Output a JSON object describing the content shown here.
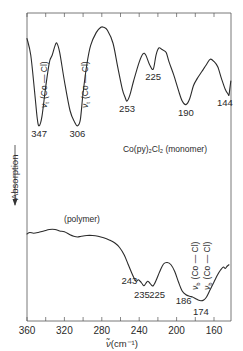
{
  "chart_data": {
    "type": "line",
    "title": "",
    "xlabel": "ν̃(cm⁻¹)",
    "ylabel": "Absorption",
    "ylabel_arrow": "down",
    "xlim": [
      360,
      142
    ],
    "x_reversed": true,
    "x_ticks": [
      360,
      320,
      280,
      240,
      200,
      160
    ],
    "x_tick_labels": [
      "360",
      "320",
      "280",
      "240",
      "200",
      "160"
    ],
    "x_minor_tick_step": 20,
    "y_ticks": [],
    "grid": false,
    "series": [
      {
        "name": "Co(py)2Cl2 (monomer)",
        "label": "Co(py)₂Cl₂ (monomer)",
        "points": [
          [
            360,
            0.86
          ],
          [
            356,
            0.72
          ],
          [
            352,
            0.42
          ],
          [
            349,
            0.18
          ],
          [
            347,
            0.12
          ],
          [
            344,
            0.2
          ],
          [
            340,
            0.45
          ],
          [
            336,
            0.66
          ],
          [
            333,
            0.72
          ],
          [
            330,
            0.8
          ],
          [
            328,
            0.82
          ],
          [
            325,
            0.74
          ],
          [
            320,
            0.5
          ],
          [
            314,
            0.25
          ],
          [
            309,
            0.15
          ],
          [
            306,
            0.12
          ],
          [
            303,
            0.17
          ],
          [
            300,
            0.4
          ],
          [
            296,
            0.64
          ],
          [
            292,
            0.8
          ],
          [
            286,
            0.91
          ],
          [
            281,
            0.955
          ],
          [
            278,
            0.955
          ],
          [
            274,
            0.93
          ],
          [
            268,
            0.82
          ],
          [
            263,
            0.62
          ],
          [
            258,
            0.43
          ],
          [
            255,
            0.36
          ],
          [
            253,
            0.33
          ],
          [
            250,
            0.38
          ],
          [
            246,
            0.5
          ],
          [
            240,
            0.66
          ],
          [
            236,
            0.73
          ],
          [
            233,
            0.72
          ],
          [
            229,
            0.64
          ],
          [
            225,
            0.6
          ],
          [
            222,
            0.72
          ],
          [
            219,
            0.78
          ],
          [
            216,
            0.77
          ],
          [
            214,
            0.76
          ],
          [
            211,
            0.74
          ],
          [
            208,
            0.66
          ],
          [
            203,
            0.55
          ],
          [
            198,
            0.42
          ],
          [
            194,
            0.33
          ],
          [
            190,
            0.3
          ],
          [
            186,
            0.35
          ],
          [
            182,
            0.46
          ],
          [
            178,
            0.52
          ],
          [
            173,
            0.58
          ],
          [
            168,
            0.64
          ],
          [
            164,
            0.685
          ],
          [
            160,
            0.665
          ],
          [
            156,
            0.62
          ],
          [
            152,
            0.52
          ],
          [
            148,
            0.43
          ],
          [
            145,
            0.39
          ],
          [
            144,
            0.38
          ],
          [
            143,
            0.44
          ],
          [
            142,
            0.5
          ]
        ],
        "peak_labels": [
          {
            "x": 347,
            "label": "347"
          },
          {
            "x": 306,
            "label": "306"
          },
          {
            "x": 253,
            "label": "253"
          },
          {
            "x": 225,
            "label": "225"
          },
          {
            "x": 190,
            "label": "190"
          },
          {
            "x": 144,
            "label": "144"
          }
        ]
      },
      {
        "name": "polymer",
        "label": "(polymer)",
        "points": [
          [
            360,
            0.44
          ],
          [
            357,
            0.45
          ],
          [
            353,
            0.445
          ],
          [
            348,
            0.45
          ],
          [
            342,
            0.46
          ],
          [
            336,
            0.47
          ],
          [
            330,
            0.47
          ],
          [
            325,
            0.46
          ],
          [
            320,
            0.455
          ],
          [
            314,
            0.435
          ],
          [
            310,
            0.425
          ],
          [
            306,
            0.42
          ],
          [
            302,
            0.425
          ],
          [
            296,
            0.43
          ],
          [
            290,
            0.43
          ],
          [
            284,
            0.425
          ],
          [
            278,
            0.415
          ],
          [
            272,
            0.4
          ],
          [
            266,
            0.38
          ],
          [
            261,
            0.35
          ],
          [
            256,
            0.3
          ],
          [
            252,
            0.24
          ],
          [
            248,
            0.18
          ],
          [
            245,
            0.14
          ],
          [
            243,
            0.125
          ],
          [
            241,
            0.135
          ],
          [
            239,
            0.125
          ],
          [
            237,
            0.11
          ],
          [
            235,
            0.095
          ],
          [
            233,
            0.11
          ],
          [
            231,
            0.125
          ],
          [
            229,
            0.115
          ],
          [
            227,
            0.1
          ],
          [
            225,
            0.095
          ],
          [
            222,
            0.13
          ],
          [
            218,
            0.19
          ],
          [
            214,
            0.24
          ],
          [
            210,
            0.25
          ],
          [
            206,
            0.235
          ],
          [
            202,
            0.19
          ],
          [
            198,
            0.12
          ],
          [
            194,
            0.06
          ],
          [
            190,
            0.035
          ],
          [
            186,
            0.025
          ],
          [
            183,
            0.02
          ],
          [
            180,
            0.01
          ],
          [
            177,
            0.0
          ],
          [
            174,
            -0.005
          ],
          [
            171,
            0.0
          ],
          [
            168,
            0.02
          ],
          [
            164,
            0.07
          ],
          [
            160,
            0.12
          ],
          [
            156,
            0.17
          ],
          [
            153,
            0.2
          ],
          [
            150,
            0.22
          ],
          [
            148,
            0.21
          ],
          [
            146,
            0.225
          ],
          [
            144,
            0.235
          ]
        ],
        "peak_labels": [
          {
            "x": 243,
            "label": "243"
          },
          {
            "x": 235,
            "label": "235"
          },
          {
            "x": 225,
            "label": "225"
          },
          {
            "x": 186,
            "label": "186"
          },
          {
            "x": 174,
            "label": "174"
          }
        ]
      }
    ],
    "annotations": [
      {
        "text": "ν_t (Co — Cl)",
        "near_x": 347,
        "series": "monomer",
        "orientation": "vertical"
      },
      {
        "text": "ν_t (Co — Cl)",
        "near_x": 306,
        "series": "monomer",
        "orientation": "vertical"
      },
      {
        "text": "ν_b (Co — Cl)",
        "near_x": 186,
        "series": "polymer",
        "orientation": "vertical"
      },
      {
        "text": "ν_b (Co — Cl)",
        "near_x": 174,
        "series": "polymer",
        "orientation": "vertical"
      }
    ]
  },
  "labels": {
    "monomer_label": "Co(py)₂Cl₂ (monomer)",
    "polymer_label": "(polymer)",
    "ylabel": "Absorption",
    "xlabel_main": "ν̃",
    "xlabel_unit": "(cm⁻¹)",
    "nu_symbol": "ν",
    "sub_terminal": "t",
    "sub_bridging": "b",
    "bond_text": "(Co — Cl)"
  }
}
